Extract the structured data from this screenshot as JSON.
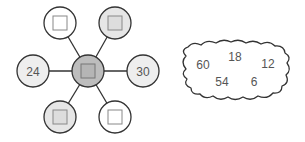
{
  "diagram": {
    "type": "number-web-puzzle",
    "center": {
      "label": "",
      "box": true,
      "fill": "#bdbdbd"
    },
    "nodes": [
      {
        "id": "top-left",
        "label": "",
        "box": true,
        "fill": "#ffffff"
      },
      {
        "id": "top-right",
        "label": "",
        "box": true,
        "fill": "#e6e6e6"
      },
      {
        "id": "left",
        "label": "24",
        "box": false,
        "fill": "#eeeeee"
      },
      {
        "id": "right",
        "label": "30",
        "box": false,
        "fill": "#eeeeee"
      },
      {
        "id": "bottom-left",
        "label": "",
        "box": true,
        "fill": "#e6e6e6"
      },
      {
        "id": "bottom-right",
        "label": "",
        "box": true,
        "fill": "#ffffff"
      }
    ],
    "cloud": {
      "numbers": [
        "60",
        "18",
        "12",
        "54",
        "6"
      ]
    }
  }
}
